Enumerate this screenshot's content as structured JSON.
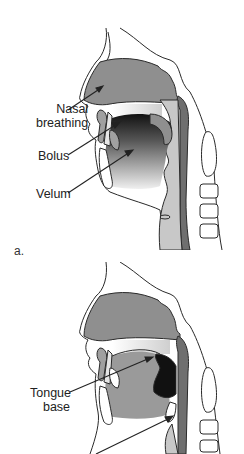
{
  "figure": {
    "panels": [
      {
        "id": "a",
        "letter": "a.",
        "labels": {
          "nasal_line1": "Nasal",
          "nasal_line2": "breathing",
          "bolus": "Bolus",
          "velum": "Velum"
        }
      },
      {
        "id": "b",
        "labels": {
          "tongue_line1": "Tongue",
          "tongue_line2": "base"
        }
      }
    ],
    "colors": {
      "outline": "#2a2a2a",
      "nasal_cavity": "#8f8f8f",
      "pharynx_dark": "#6f6f6f",
      "oral_dark": "#1a1a1a",
      "tissue_light": "#c8c8c8",
      "background": "#ffffff"
    }
  }
}
